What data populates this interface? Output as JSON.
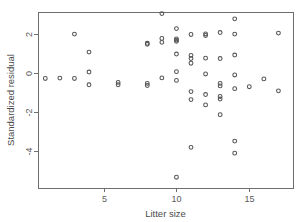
{
  "chart_data": {
    "type": "scatter",
    "title": "",
    "xlabel": "Litter size",
    "ylabel": "Standardized residual",
    "xlim": [
      0.5,
      18.0
    ],
    "ylim": [
      -5.9,
      3.1
    ],
    "xticks": [
      5,
      10,
      15
    ],
    "yticks": [
      2,
      0,
      -2,
      -4
    ],
    "xtick_labels": [
      "5",
      "10",
      "15"
    ],
    "ytick_labels": [
      "2",
      "0",
      "-2",
      "-4"
    ],
    "grid": false,
    "legend": null,
    "marker": "open-circle",
    "marker_color": "#555555",
    "points": [
      {
        "x": 1,
        "y": -0.3
      },
      {
        "x": 2,
        "y": -0.28
      },
      {
        "x": 3,
        "y": 1.97
      },
      {
        "x": 3,
        "y": -0.3
      },
      {
        "x": 4,
        "y": 1.05
      },
      {
        "x": 4,
        "y": 0.03
      },
      {
        "x": 4,
        "y": -0.62
      },
      {
        "x": 6,
        "y": -0.5
      },
      {
        "x": 6,
        "y": -0.62
      },
      {
        "x": 8,
        "y": 1.5
      },
      {
        "x": 8,
        "y": 1.45
      },
      {
        "x": 8,
        "y": -0.55
      },
      {
        "x": 8,
        "y": -0.66
      },
      {
        "x": 9,
        "y": 3.02
      },
      {
        "x": 9,
        "y": 1.75
      },
      {
        "x": 9,
        "y": 1.55
      },
      {
        "x": 9,
        "y": -0.27
      },
      {
        "x": 10,
        "y": 2.25
      },
      {
        "x": 10,
        "y": 1.72
      },
      {
        "x": 10,
        "y": 1.66
      },
      {
        "x": 10,
        "y": 1.6
      },
      {
        "x": 10,
        "y": 0.95
      },
      {
        "x": 10,
        "y": 0.05
      },
      {
        "x": 10,
        "y": -0.4
      },
      {
        "x": 10,
        "y": -5.35
      },
      {
        "x": 11,
        "y": 1.95
      },
      {
        "x": 11,
        "y": 0.88
      },
      {
        "x": 11,
        "y": 0.72
      },
      {
        "x": 11,
        "y": 0.48
      },
      {
        "x": 11,
        "y": -0.97
      },
      {
        "x": 11,
        "y": -1.38
      },
      {
        "x": 11,
        "y": -3.82
      },
      {
        "x": 12,
        "y": 1.98
      },
      {
        "x": 12,
        "y": 1.9
      },
      {
        "x": 12,
        "y": 0.74
      },
      {
        "x": 12,
        "y": -0.07
      },
      {
        "x": 12,
        "y": -1.12
      },
      {
        "x": 12,
        "y": -1.65
      },
      {
        "x": 13,
        "y": 2.05
      },
      {
        "x": 13,
        "y": 0.72
      },
      {
        "x": 13,
        "y": -0.55
      },
      {
        "x": 13,
        "y": -0.68
      },
      {
        "x": 13,
        "y": -1.22
      },
      {
        "x": 13,
        "y": -1.35
      },
      {
        "x": 13,
        "y": -2.15
      },
      {
        "x": 14,
        "y": 2.75
      },
      {
        "x": 14,
        "y": 1.97
      },
      {
        "x": 14,
        "y": 0.9
      },
      {
        "x": 14,
        "y": -0.12
      },
      {
        "x": 14,
        "y": -0.82
      },
      {
        "x": 14,
        "y": -3.5
      },
      {
        "x": 14,
        "y": -4.12
      },
      {
        "x": 15,
        "y": -0.72
      },
      {
        "x": 16,
        "y": -0.32
      },
      {
        "x": 17,
        "y": 2.02
      },
      {
        "x": 17,
        "y": -0.93
      }
    ]
  },
  "axes": {
    "frame_color": "#6e6e6e",
    "background": "#ffffff"
  }
}
